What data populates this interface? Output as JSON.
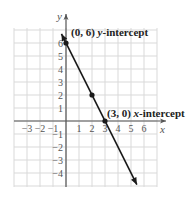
{
  "chart_data": {
    "type": "line",
    "title": "",
    "xlabel": "x",
    "ylabel": "y",
    "xlim": [
      -4,
      7
    ],
    "ylim": [
      -5,
      7
    ],
    "grid": true,
    "x_ticks": [
      "-3",
      "-2",
      "-1",
      "1",
      "2",
      "3",
      "4",
      "5",
      "6"
    ],
    "y_ticks": [
      "6",
      "5",
      "4",
      "3",
      "2",
      "1",
      "-1",
      "-2",
      "-3",
      "-4"
    ],
    "series": [
      {
        "name": "line",
        "points": [
          [
            0,
            6
          ],
          [
            2,
            2
          ],
          [
            3,
            0
          ]
        ],
        "slope": -2,
        "intercept": 6,
        "color": "#1a1a1a"
      }
    ],
    "annotations": [
      {
        "point": [
          0,
          6
        ],
        "coords_label": "(0, 6)",
        "variable": "y",
        "label": "-intercept"
      },
      {
        "point": [
          3,
          0
        ],
        "coords_label": "(3, 0)",
        "variable": "x",
        "label": "-intercept"
      }
    ]
  },
  "colors": {
    "grid": "#d9d9d9",
    "axis": "#555555",
    "line": "#1a1a1a"
  }
}
